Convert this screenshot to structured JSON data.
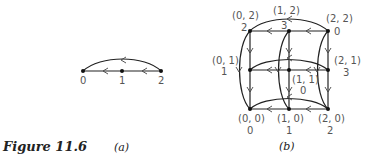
{
  "figure": {
    "caption": "Figure 11.6",
    "panel_a": {
      "label": "(a)",
      "nodes": [
        {
          "id": "0",
          "label": "0"
        },
        {
          "id": "1",
          "label": "1"
        },
        {
          "id": "2",
          "label": "2"
        }
      ],
      "edges": [
        {
          "from": "2",
          "to": "1",
          "type": "straight"
        },
        {
          "from": "1",
          "to": "0",
          "type": "straight"
        },
        {
          "from": "2",
          "to": "0",
          "type": "arc"
        }
      ]
    },
    "panel_b": {
      "label": "(b)",
      "nodes": [
        {
          "id": "00",
          "coord": "(0, 0)",
          "value": "0"
        },
        {
          "id": "10",
          "coord": "(1, 0)",
          "value": "1"
        },
        {
          "id": "20",
          "coord": "(2, 0)",
          "value": "2"
        },
        {
          "id": "01",
          "coord": "(0, 1)",
          "value": "1"
        },
        {
          "id": "11",
          "coord": "(1, 1)",
          "value": "0"
        },
        {
          "id": "21",
          "coord": "(2, 1)",
          "value": "3"
        },
        {
          "id": "02",
          "coord": "(0, 2)",
          "value": "2"
        },
        {
          "id": "12",
          "coord": "(1, 2)",
          "value": "3"
        },
        {
          "id": "22",
          "coord": "(2, 2)",
          "value": "0"
        }
      ]
    }
  }
}
